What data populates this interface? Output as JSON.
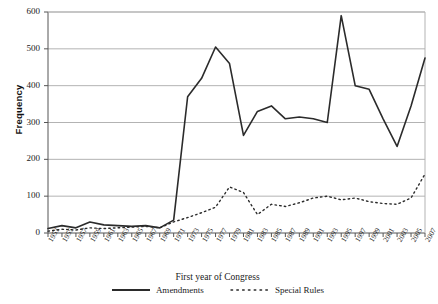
{
  "chart_data": {
    "type": "line",
    "title": "",
    "xlabel": "First year of Congress",
    "ylabel": "Frequency",
    "ylim": [
      0,
      600
    ],
    "ytick_step": 100,
    "yticks": [
      0,
      100,
      200,
      300,
      400,
      500,
      600
    ],
    "grid": true,
    "legend_position": "bottom",
    "x": [
      1953,
      1955,
      1957,
      1959,
      1961,
      1963,
      1965,
      1967,
      1969,
      1971,
      1973,
      1975,
      1977,
      1979,
      1981,
      1983,
      1985,
      1987,
      1989,
      1991,
      1993,
      1995,
      1997,
      1999,
      2001,
      2003,
      2005,
      2007
    ],
    "categories": [
      "1953",
      "1955",
      "1957",
      "1959",
      "1961",
      "1963",
      "1965",
      "1967",
      "1969",
      "1971",
      "1973",
      "1975",
      "1977",
      "1979",
      "1981",
      "1983",
      "1985",
      "1987",
      "1989",
      "1991",
      "1993",
      "1995",
      "1997",
      "1999",
      "2001",
      "2003",
      "2005",
      "2007"
    ],
    "series": [
      {
        "name": "Amendments",
        "style": "solid",
        "color": "#2b2b2b",
        "values": [
          12,
          20,
          14,
          30,
          22,
          20,
          18,
          20,
          14,
          35,
          370,
          420,
          505,
          460,
          265,
          330,
          345,
          310,
          315,
          310,
          300,
          590,
          400,
          390,
          310,
          235,
          345,
          475
        ]
      },
      {
        "name": "Special Rules",
        "style": "dotted",
        "color": "#2b2b2b",
        "values": [
          5,
          10,
          8,
          14,
          12,
          14,
          16,
          18,
          14,
          30,
          42,
          55,
          70,
          125,
          110,
          50,
          78,
          72,
          82,
          95,
          100,
          90,
          95,
          85,
          80,
          78,
          95,
          160
        ]
      }
    ]
  },
  "legend": {
    "amendments_label": "Amendments",
    "special_rules_label": "Special Rules"
  },
  "axis": {
    "x_title": "First year of Congress",
    "y_title": "Frequency"
  },
  "colors": {
    "line": "#2b2b2b",
    "grid": "#b3b3b3",
    "axis": "#555555",
    "background": "#ffffff"
  }
}
